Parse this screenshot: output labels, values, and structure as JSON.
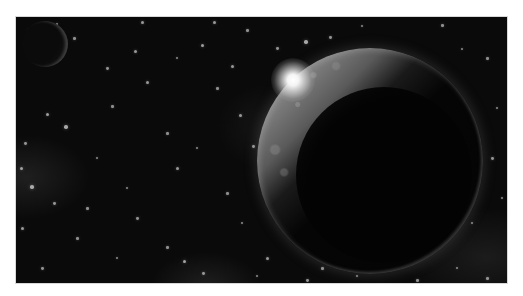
{
  "scene": {
    "description": "Grayscale space scene with a large partially lit planet and a sun flare",
    "colors": {
      "page_background": "#ffffff",
      "space": "#0a0a0a",
      "planet_lit": "#9a9a9a",
      "planet_dark": "#040404",
      "flare": "#ffffff",
      "star": "#cfcfcf"
    },
    "frame": {
      "x": 16,
      "y": 17,
      "width": 491,
      "height": 266
    },
    "planet": {
      "cx": 354,
      "cy": 144,
      "r": 113
    },
    "moon": {
      "cx": 29,
      "cy": 27,
      "r": 23
    },
    "flare": {
      "cx": 277,
      "cy": 63,
      "r": 22
    },
    "stars": [
      [
        12,
        12,
        1.5
      ],
      [
        40,
        6,
        1.2
      ],
      [
        125,
        4,
        1.5
      ],
      [
        197,
        4,
        1.5
      ],
      [
        230,
        12,
        1.3
      ],
      [
        288,
        23,
        1.8
      ],
      [
        313,
        19,
        1.4
      ],
      [
        345,
        8,
        1.2
      ],
      [
        425,
        7,
        1.3
      ],
      [
        445,
        31,
        1.2
      ],
      [
        57,
        20,
        1.3
      ],
      [
        118,
        33,
        1.5
      ],
      [
        160,
        40,
        1.2
      ],
      [
        215,
        48,
        1.5
      ],
      [
        20,
        37,
        1.3
      ],
      [
        90,
        50,
        1.4
      ],
      [
        185,
        27,
        1.6
      ],
      [
        260,
        30,
        1.4
      ],
      [
        470,
        40,
        1.3
      ],
      [
        480,
        90,
        1.2
      ],
      [
        48,
        108,
        1.8
      ],
      [
        30,
        96,
        1.6
      ],
      [
        95,
        88,
        1.3
      ],
      [
        130,
        64,
        1.5
      ],
      [
        150,
        115,
        1.3
      ],
      [
        223,
        97,
        1.5
      ],
      [
        236,
        128,
        1.4
      ],
      [
        247,
        140,
        1.7
      ],
      [
        180,
        130,
        1.2
      ],
      [
        160,
        150,
        1.5
      ],
      [
        4,
        150,
        1.6
      ],
      [
        14,
        168,
        1.8
      ],
      [
        37,
        185,
        1.4
      ],
      [
        70,
        190,
        1.3
      ],
      [
        120,
        200,
        1.4
      ],
      [
        150,
        229,
        1.3
      ],
      [
        167,
        243,
        1.7
      ],
      [
        186,
        255,
        1.4
      ],
      [
        100,
        240,
        1.2
      ],
      [
        60,
        220,
        1.3
      ],
      [
        5,
        210,
        1.5
      ],
      [
        25,
        250,
        1.4
      ],
      [
        210,
        175,
        1.3
      ],
      [
        225,
        205,
        1.2
      ],
      [
        250,
        240,
        1.5
      ],
      [
        240,
        258,
        1.2
      ],
      [
        290,
        262,
        1.4
      ],
      [
        400,
        262,
        1.3
      ],
      [
        455,
        205,
        1.2
      ],
      [
        475,
        140,
        1.4
      ],
      [
        485,
        180,
        1.2
      ],
      [
        8,
        125,
        1.4
      ],
      [
        80,
        140,
        1.2
      ],
      [
        200,
        70,
        1.3
      ],
      [
        275,
        98,
        1.2
      ],
      [
        305,
        250,
        1.3
      ],
      [
        340,
        258,
        1.2
      ],
      [
        440,
        250,
        1.2
      ],
      [
        470,
        260,
        1.3
      ],
      [
        110,
        170,
        1.2
      ]
    ]
  }
}
